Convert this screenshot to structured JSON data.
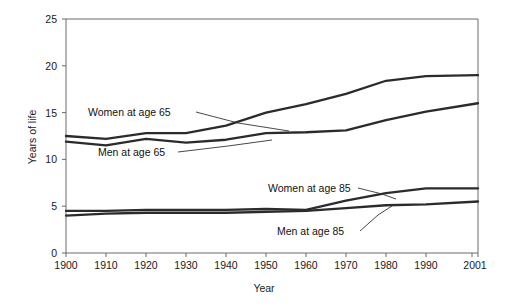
{
  "chart_data": {
    "type": "line",
    "title": "",
    "xlabel": "Year",
    "ylabel": "Years of life",
    "xlim": [
      1900,
      2001
    ],
    "ylim": [
      0,
      25
    ],
    "grid": false,
    "legend_position": "inline-annotations",
    "x": [
      1900,
      1910,
      1920,
      1930,
      1940,
      1950,
      1960,
      1970,
      1980,
      1990,
      2001
    ],
    "xtick_labels": [
      "1900",
      "1910",
      "1920",
      "1930",
      "1940",
      "1950",
      "1960",
      "1970",
      "1980",
      "1990",
      "2001"
    ],
    "ytick_labels": [
      "0",
      "5",
      "10",
      "15",
      "20",
      "25"
    ],
    "ytick_values": [
      0,
      5,
      10,
      15,
      20,
      25
    ],
    "series": [
      {
        "name": "Women at age 65",
        "values": [
          12.5,
          12.2,
          12.8,
          12.8,
          13.6,
          15.0,
          15.9,
          17.0,
          18.4,
          18.9,
          19.0
        ]
      },
      {
        "name": "Men at age 65",
        "values": [
          11.9,
          11.5,
          12.2,
          11.8,
          12.1,
          12.8,
          12.9,
          13.1,
          14.2,
          15.1,
          16.0
        ]
      },
      {
        "name": "Women at age 85",
        "values": [
          4.5,
          4.5,
          4.6,
          4.6,
          4.6,
          4.7,
          4.6,
          5.6,
          6.4,
          6.9,
          6.9
        ]
      },
      {
        "name": "Men at age 85",
        "values": [
          4.0,
          4.2,
          4.3,
          4.3,
          4.3,
          4.4,
          4.5,
          4.8,
          5.1,
          5.2,
          5.5
        ]
      }
    ],
    "annotations": [
      {
        "label": "Women at age 65",
        "text_x": 88,
        "text_y": 116,
        "leader": "M196,112 L238,123 L289,131"
      },
      {
        "label": "Men at age 65",
        "text_x": 98,
        "text_y": 156,
        "leader": "M178,152 L228,146 L272,140"
      },
      {
        "label": "Women at age 85",
        "text_x": 268,
        "text_y": 192,
        "leader": "M358,188 L382,194 L396,199"
      },
      {
        "label": "Men at age 85",
        "text_x": 277,
        "text_y": 235,
        "leader": "M360,231 L378,215 L392,206"
      }
    ]
  }
}
